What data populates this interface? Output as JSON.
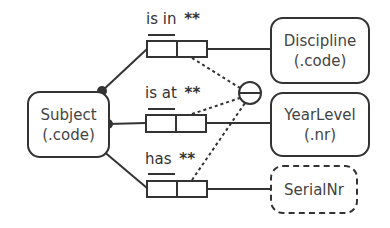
{
  "entities": {
    "subject": {
      "name": "Subject",
      "ref": "(.code)"
    },
    "discipline": {
      "name": "Discipline",
      "ref": "(.code)"
    },
    "yearlevel": {
      "name": "YearLevel",
      "ref": "(.nr)"
    },
    "serialnr": {
      "name": "SerialNr"
    }
  },
  "facts": [
    {
      "reading": "is in",
      "constraint": "**"
    },
    {
      "reading": "is at",
      "constraint": "**"
    },
    {
      "reading": "has",
      "constraint": "**"
    }
  ],
  "external_uniqueness": {
    "symbol": "circle-with-bar"
  },
  "colors": {
    "line": "#333333",
    "text": "#444444"
  }
}
